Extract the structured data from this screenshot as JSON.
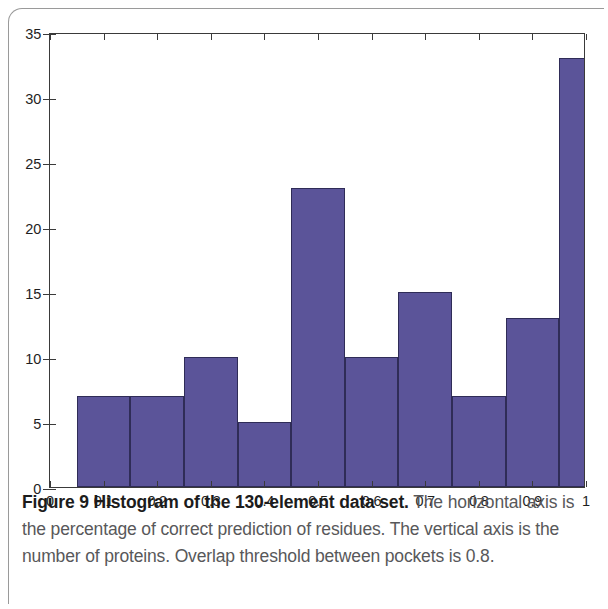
{
  "figure": {
    "caption_bold": "Figure 9 Histogram of the 130-element data set.",
    "caption_rest": " The horizontal axis is the percentage of correct prediction of residues. The vertical axis is the number of proteins. Overlap threshold between pockets is 0.8."
  },
  "colors": {
    "bar_fill": "#5b5499",
    "bar_edge": "#2f2c57",
    "axis": "#3a3a3a",
    "caption_text": "#58585a",
    "background": "#ffffff"
  },
  "chart_data": {
    "type": "bar",
    "title": "",
    "subtitle": "",
    "xlabel": "",
    "ylabel": "",
    "xlim": [
      0,
      1
    ],
    "ylim": [
      0,
      35
    ],
    "grid": false,
    "legend": null,
    "bin_width": 0.1,
    "bin_starts": [
      0.05,
      0.15,
      0.25,
      0.35,
      0.45,
      0.55,
      0.65,
      0.75,
      0.85,
      0.95
    ],
    "bin_ends": [
      0.15,
      0.25,
      0.35,
      0.45,
      0.55,
      0.65,
      0.75,
      0.85,
      0.95,
      1.05
    ],
    "categories": [
      "0.05-0.15",
      "0.15-0.25",
      "0.25-0.35",
      "0.35-0.45",
      "0.45-0.55",
      "0.55-0.65",
      "0.65-0.75",
      "0.75-0.85",
      "0.85-0.95",
      "0.95-1.05"
    ],
    "values": [
      7,
      7,
      10,
      5,
      23,
      10,
      15,
      7,
      13,
      33
    ],
    "total": 130,
    "xticks": [
      0,
      0.1,
      0.2,
      0.3,
      0.4,
      0.5,
      0.6,
      0.7,
      0.8,
      0.9,
      1
    ],
    "xticklabels": [
      "0",
      "0.1",
      "0.2",
      "0.3",
      "0.4",
      "0.5",
      "0.6",
      "0.7",
      "0.8",
      "0.9",
      "1"
    ],
    "yticks": [
      0,
      5,
      10,
      15,
      20,
      25,
      30,
      35
    ],
    "yticklabels": [
      "0",
      "5",
      "10",
      "15",
      "20",
      "25",
      "30",
      "35"
    ]
  }
}
